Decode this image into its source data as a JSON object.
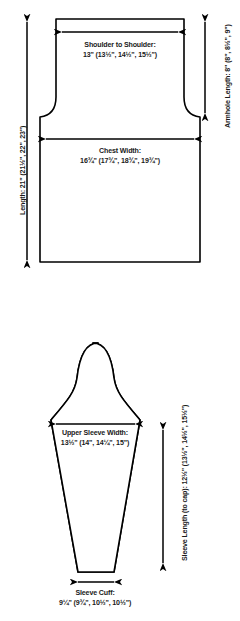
{
  "diagram": {
    "type": "knitting-pattern-schematic",
    "line_color": "#000000",
    "fill_color": "#ffffff",
    "text_color": "#1a1a1a",
    "pieces": [
      {
        "name": "body",
        "label": "Body / Front-Back Piece"
      },
      {
        "name": "sleeve",
        "label": "Sleeve Piece"
      }
    ]
  },
  "body_piece": {
    "shoulder_to_shoulder": {
      "name": "Shoulder to Shoulder:",
      "values": "13\" (13½\", 14½\", 15½\")"
    },
    "chest_width": {
      "name": "Chest Width:",
      "values": "16¾\" (17¾\", 18¾\", 19¾\")"
    },
    "length": {
      "name": "Length:",
      "values": "21\" (21½\", 22\", 23\")",
      "full": "Length: 21\" (21½\", 22\", 23\")"
    },
    "armhole_length": {
      "name": "Armhole Length:",
      "values": "8\" (8\", 8½\", 9\")",
      "full": "Armhole Length: 8\" (8\", 8½\", 9\")"
    }
  },
  "sleeve_piece": {
    "upper_sleeve_width": {
      "name": "Upper Sleeve Width:",
      "values": "13½\" (14\", 14¼\", 15\")"
    },
    "sleeve_cuff": {
      "name": "Sleeve Cuff:",
      "values": "9¼\" (9¾\", 10½\", 10½\")"
    },
    "sleeve_length": {
      "name": "Sleeve Length (to cap):",
      "values": "12½\" (13½\", 14½\", 15½\")",
      "full": "Sleeve Length (to cap): 12½\" (13½\", 14½\", 15½\")"
    }
  }
}
